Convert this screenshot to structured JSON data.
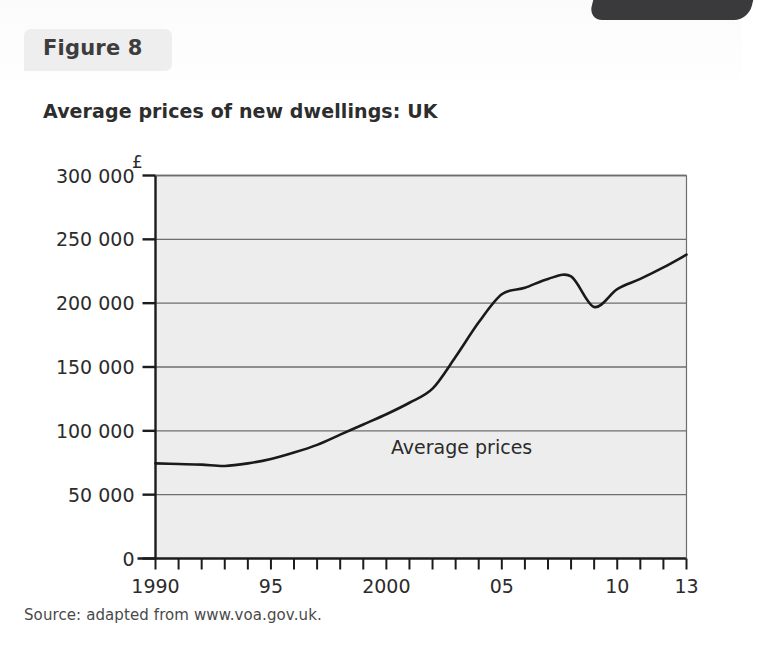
{
  "figure": {
    "chip_label": "Figure 8",
    "title": "Average prices of new dwellings: UK",
    "source": "Source: adapted from www.voa.gov.uk."
  },
  "colors": {
    "plot_background": "#ededed",
    "gridline": "#6e6e6e",
    "axis": "#1c1c1c",
    "series_line": "#1a1a1a",
    "chip_background": "#eeeeee",
    "page_background": "#ffffff",
    "corner_tab": "#3a3a3c",
    "text": "#2b2b2b"
  },
  "chart_data": {
    "type": "line",
    "title": "Average prices of new dwellings: UK",
    "subtitle": "",
    "xlabel": "",
    "ylabel": "£",
    "y_unit_symbol": "£",
    "xlim": [
      1990,
      2013
    ],
    "ylim": [
      0,
      300000
    ],
    "grid": true,
    "grid_axis": "y",
    "legend_position": "inline-annotation",
    "ytick_labels": [
      "0",
      "50 000",
      "100 000",
      "150 000",
      "200 000",
      "250 000",
      "300 000"
    ],
    "ytick_values": [
      0,
      50000,
      100000,
      150000,
      200000,
      250000,
      300000
    ],
    "xtick_labels": [
      "1990",
      "95",
      "2000",
      "05",
      "10",
      "13"
    ],
    "xtick_label_values": [
      1990,
      1995,
      2000,
      2005,
      2010,
      2013
    ],
    "xtick_minor_values": [
      1990,
      1991,
      1992,
      1993,
      1994,
      1995,
      1996,
      1997,
      1998,
      1999,
      2000,
      2001,
      2002,
      2003,
      2004,
      2005,
      2006,
      2007,
      2008,
      2009,
      2010,
      2011,
      2012,
      2013
    ],
    "annotations": [
      {
        "text": "Average prices",
        "x": 2000.2,
        "y": 82000
      }
    ],
    "series": [
      {
        "name": "Average prices",
        "x": [
          1990,
          1991,
          1992,
          1993,
          1994,
          1995,
          1996,
          1997,
          1998,
          1999,
          2000,
          2001,
          2002,
          2003,
          2004,
          2005,
          2006,
          2007,
          2008,
          2009,
          2010,
          2011,
          2012,
          2013
        ],
        "values": [
          74500,
          74000,
          73500,
          72500,
          74500,
          78000,
          83000,
          89000,
          97000,
          105000,
          113000,
          122000,
          133000,
          158000,
          185000,
          207000,
          212000,
          219000,
          221000,
          197000,
          211000,
          219000,
          228000,
          238000
        ]
      }
    ]
  }
}
